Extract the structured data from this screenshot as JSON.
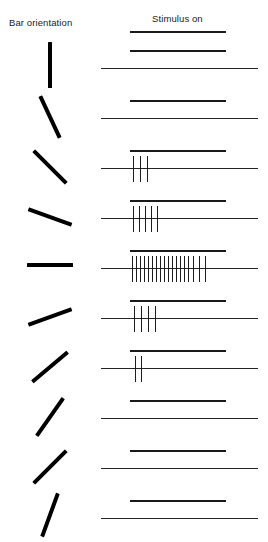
{
  "figure": {
    "width": 268,
    "height": 542,
    "background": "#ffffff",
    "ink": "#000000"
  },
  "headers": {
    "left_column": "Bar orientation",
    "right_column": "Stimulus on"
  },
  "chart_data": {
    "type": "raster",
    "title": "",
    "subtitle": "",
    "xlabel": "",
    "ylabel": "",
    "grid": false,
    "legend_position": "none",
    "annotations": [
      "Bar orientation",
      "Stimulus on"
    ],
    "axis_ranges": {
      "time_axis_px": [
        101,
        258
      ],
      "stimulus_epoch_px": [
        130,
        226
      ]
    },
    "spike_count_peak": 18,
    "spike_count_min": 0,
    "preferred_orientation_deg": 0,
    "categories": [
      "90°",
      "115°",
      "135°",
      "160°",
      "0°",
      "20°",
      "40°",
      "55°",
      "45°",
      "70°"
    ],
    "values": [
      0,
      0,
      3,
      5,
      18,
      4,
      2,
      0,
      0,
      0
    ],
    "rows": [
      {
        "index": 1,
        "orientation_deg": 90,
        "orientation_label": "90° vertical",
        "bar_length_px": 46,
        "spike_count": 0,
        "spike_offsets": []
      },
      {
        "index": 2,
        "orientation_deg": 115,
        "orientation_label": "115°",
        "bar_length_px": 46,
        "spike_count": 0,
        "spike_offsets": []
      },
      {
        "index": 3,
        "orientation_deg": 135,
        "orientation_label": "135°",
        "bar_length_px": 46,
        "spike_count": 3,
        "spike_offsets": [
          3,
          10,
          17
        ]
      },
      {
        "index": 4,
        "orientation_deg": 160,
        "orientation_label": "160°",
        "bar_length_px": 46,
        "spike_count": 5,
        "spike_offsets": [
          3,
          9,
          15,
          21,
          27
        ]
      },
      {
        "index": 5,
        "orientation_deg": 0,
        "orientation_label": "0° horizontal (preferred)",
        "bar_length_px": 46,
        "spike_count": 18,
        "spike_offsets": [
          2,
          6,
          10,
          14,
          18,
          22,
          26,
          30,
          34,
          38,
          42,
          46,
          50,
          54,
          58,
          63,
          69,
          75
        ]
      },
      {
        "index": 6,
        "orientation_deg": 20,
        "orientation_label": "20°",
        "bar_length_px": 46,
        "spike_count": 4,
        "spike_offsets": [
          4,
          11,
          18,
          25
        ]
      },
      {
        "index": 7,
        "orientation_deg": 40,
        "orientation_label": "40°",
        "bar_length_px": 46,
        "spike_count": 2,
        "spike_offsets": [
          5,
          11
        ]
      },
      {
        "index": 8,
        "orientation_deg": 55,
        "orientation_label": "55°",
        "bar_length_px": 46,
        "spike_count": 0,
        "spike_offsets": []
      },
      {
        "index": 9,
        "orientation_deg": 45,
        "orientation_label": "45°",
        "bar_length_px": 46,
        "spike_count": 0,
        "spike_offsets": []
      },
      {
        "index": 10,
        "orientation_deg": 70,
        "orientation_label": "70°",
        "bar_length_px": 46,
        "spike_count": 0,
        "spike_offsets": []
      }
    ]
  },
  "layout": {
    "row_tops": [
      38,
      88,
      138,
      188,
      238,
      288,
      338,
      388,
      438,
      488
    ],
    "bar_cell_tops": [
      40,
      92,
      142,
      192,
      240,
      292,
      342,
      392,
      442,
      490
    ],
    "baseline_offset_y": 30,
    "stim_offset_y": 12,
    "spike_height": 26
  }
}
